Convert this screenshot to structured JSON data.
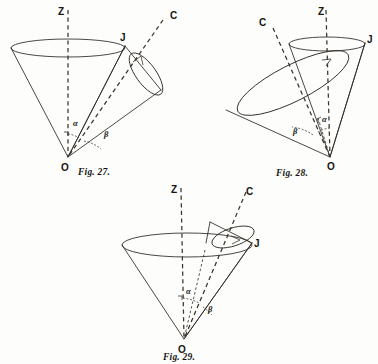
{
  "page": {
    "kind": "book-plate",
    "background_color": "#fdfdfb",
    "ink_color": "#2b2722"
  },
  "figures": [
    {
      "id": "fig27",
      "caption": "Fig. 27.",
      "labels": {
        "axis_z": "Z",
        "axis_c": "C",
        "vector_j": "J",
        "apex_o": "O",
        "angle_alpha": "α",
        "angle_beta": "β"
      }
    },
    {
      "id": "fig28",
      "caption": "Fig. 28.",
      "labels": {
        "axis_z": "Z",
        "axis_c": "C",
        "vector_j": "J",
        "apex_o": "O",
        "angle_alpha": "α",
        "angle_beta": "β"
      }
    },
    {
      "id": "fig29",
      "caption": "Fig. 29.",
      "labels": {
        "axis_z": "Z",
        "axis_c": "C",
        "vector_j": "J",
        "apex_o": "O",
        "angle_alpha": "α",
        "angle_beta": "β"
      }
    }
  ]
}
